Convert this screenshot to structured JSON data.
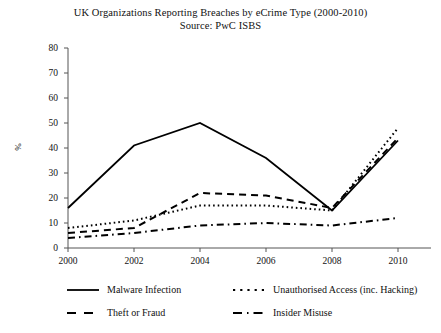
{
  "chart_data": {
    "type": "line",
    "title": "UK Organizations Reporting Breaches by eCrime Type (2000-2010)",
    "subtitle": "Source: PwC ISBS",
    "xlabel": "",
    "ylabel": "%",
    "xlim": [
      2000,
      2010
    ],
    "ylim": [
      0,
      80
    ],
    "ytick_labels": [
      "80",
      "70",
      "60",
      "50",
      "40",
      "30",
      "20",
      "10",
      "0"
    ],
    "ytick_values": [
      80,
      70,
      60,
      50,
      40,
      30,
      20,
      10,
      0
    ],
    "xtick_labels": [
      "2000",
      "2002",
      "2004",
      "2006",
      "2008",
      "2010"
    ],
    "xtick_values": [
      2000,
      2002,
      2004,
      2006,
      2008,
      2010
    ],
    "x": [
      2000,
      2002,
      2004,
      2006,
      2008,
      2010
    ],
    "grid": false,
    "legend_position": "bottom",
    "series": [
      {
        "name": "Malware Infection",
        "style": "solid",
        "color": "#000000",
        "values": [
          16,
          41,
          50,
          36,
          15,
          43
        ]
      },
      {
        "name": "Unauthorised Access (inc. Hacking)",
        "style": "dotted",
        "color": "#000000",
        "values": [
          8,
          11,
          17,
          17,
          15,
          48
        ]
      },
      {
        "name": "Theft or Fraud",
        "style": "dashed",
        "color": "#000000",
        "values": [
          6,
          8,
          22,
          21,
          16,
          44
        ]
      },
      {
        "name": "Insider Misuse",
        "style": "dashdot",
        "color": "#000000",
        "values": [
          4,
          6,
          9,
          10,
          9,
          12
        ]
      }
    ]
  },
  "legend": {
    "items": [
      {
        "label": "Malware Infection",
        "style": "solid"
      },
      {
        "label": "Unauthorised Access (inc. Hacking)",
        "style": "dotted"
      },
      {
        "label": "Theft or Fraud",
        "style": "dashed"
      },
      {
        "label": "Insider Misuse",
        "style": "dashdot"
      }
    ]
  }
}
